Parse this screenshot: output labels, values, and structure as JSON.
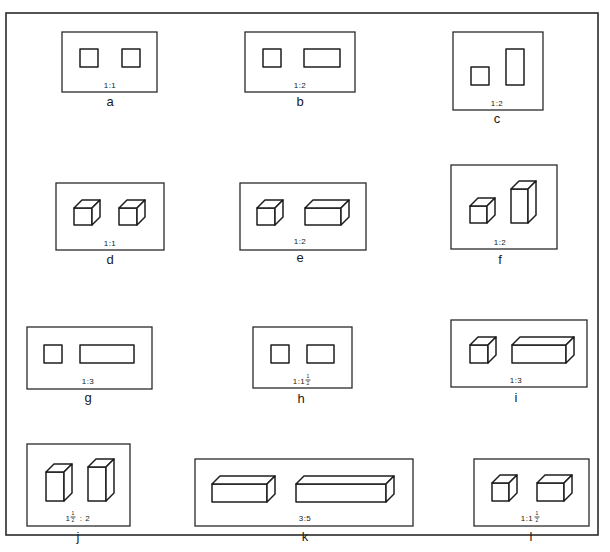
{
  "figure": {
    "colors": {
      "stroke": "#1e1e1e",
      "background": "#ffffff"
    },
    "panels": [
      {
        "id": "a",
        "letter": "a",
        "ratio": "1:1",
        "kind": "2d",
        "box": [
          62,
          32,
          95,
          60
        ]
      },
      {
        "id": "b",
        "letter": "b",
        "ratio": "1:2",
        "kind": "2d",
        "box": [
          245,
          32,
          110,
          60
        ]
      },
      {
        "id": "c",
        "letter": "c",
        "ratio": "1:2",
        "kind": "2d",
        "box": [
          453,
          32,
          90,
          78
        ]
      },
      {
        "id": "d",
        "letter": "d",
        "ratio": "1:1",
        "kind": "3d",
        "box": [
          56,
          183,
          108,
          67
        ]
      },
      {
        "id": "e",
        "letter": "e",
        "ratio": "1:2",
        "kind": "3d",
        "box": [
          240,
          183,
          126,
          67
        ]
      },
      {
        "id": "f",
        "letter": "f",
        "ratio": "1:2",
        "kind": "3d",
        "box": [
          451,
          165,
          106,
          84
        ]
      },
      {
        "id": "g",
        "letter": "g",
        "ratio": "1:3",
        "kind": "2d",
        "box": [
          27,
          327,
          125,
          62
        ]
      },
      {
        "id": "h",
        "letter": "h",
        "ratio": "1:1½",
        "ratio_main": "1:1",
        "ratio_frac_num": "1",
        "ratio_frac_den": "2",
        "kind": "2d",
        "box": [
          253,
          327,
          99,
          61
        ]
      },
      {
        "id": "i",
        "letter": "i",
        "ratio": "1:3",
        "kind": "3d",
        "box": [
          451,
          320,
          136,
          67
        ]
      },
      {
        "id": "j",
        "letter": "j",
        "ratio": "1½:2",
        "ratio_pre": "1",
        "ratio_frac_num": "1",
        "ratio_frac_den": "2",
        "ratio_post": ": 2",
        "kind": "3d",
        "box": [
          27,
          444,
          103,
          82
        ]
      },
      {
        "id": "k",
        "letter": "k",
        "ratio": "3:5",
        "kind": "3d",
        "box": [
          195,
          459,
          218,
          67
        ]
      },
      {
        "id": "l",
        "letter": "l",
        "ratio": "1:1½",
        "ratio_main": "1:1",
        "ratio_frac_num": "1",
        "ratio_frac_den": "2",
        "kind": "3d",
        "box": [
          474,
          459,
          115,
          67
        ]
      }
    ]
  }
}
